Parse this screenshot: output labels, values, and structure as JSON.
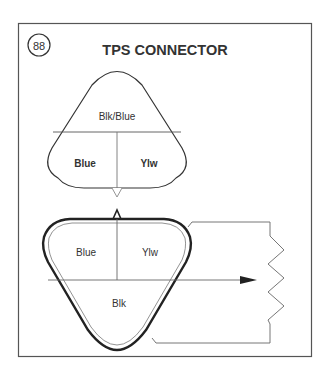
{
  "figure": {
    "number": "88",
    "title": "TPS CONNECTOR"
  },
  "harness_connector": {
    "top_cavity": "Blk/Blue",
    "bottom_left_cavity": "Blue",
    "bottom_right_cavity": "Ylw"
  },
  "component_connector": {
    "top_left_cavity": "Blue",
    "top_right_cavity": "Ylw",
    "bottom_cavity": "Blk"
  }
}
